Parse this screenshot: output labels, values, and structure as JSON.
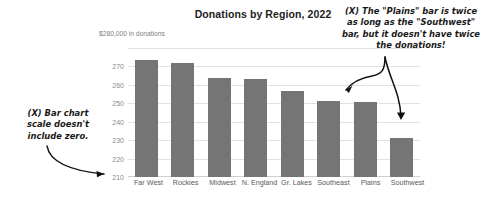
{
  "chart_data": {
    "type": "bar",
    "title": "Donations by Region, 2022",
    "axis_note": "$280,000 in donations",
    "xlabel": "",
    "ylabel": "",
    "ylim": [
      210,
      280
    ],
    "yticks": [
      210,
      220,
      230,
      240,
      250,
      260,
      270
    ],
    "ytick_labels": [
      "210",
      "220",
      "230",
      "240",
      "250",
      "260",
      "270"
    ],
    "top_label": "$280,000 in donations",
    "grid": true,
    "legend": "none",
    "bar_color": "#757575",
    "categories": [
      "Far West",
      "Rockies",
      "Midwest",
      "N. England",
      "Gr. Lakes",
      "Southeast",
      "Plains",
      "Southwest"
    ],
    "values": [
      273.5,
      272,
      264,
      263,
      256.5,
      251.5,
      250.5,
      231
    ],
    "units": "thousands of dollars"
  },
  "annotations": [
    {
      "id": "scale-note",
      "text": "(X) Bar chart scale doesn't include zero.",
      "lines": [
        "(X) Bar chart",
        "scale doesn't",
        "include zero."
      ],
      "points_to": "y-axis-minimum-210"
    },
    {
      "id": "plains-southwest-note",
      "text": "(X) The \"Plains\" bar is twice as long as the \"Southwest\" bar, but it doesn't have twice the donations!",
      "lines": [
        "(X) The \"Plains\" bar is twice",
        "as long as the \"Southwest\"",
        "bar, but it doesn't have twice",
        "the donations!"
      ],
      "points_to": [
        "plains-bar",
        "southwest-bar"
      ]
    }
  ]
}
